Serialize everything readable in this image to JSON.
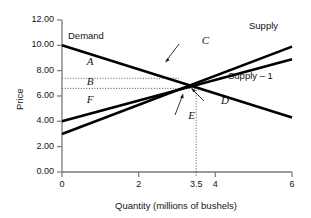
{
  "chart_data": {
    "type": "line",
    "title": "",
    "xlabel": "Quantity (millions of bushels)",
    "ylabel": "Price",
    "xlim": [
      0,
      6
    ],
    "ylim": [
      0,
      12
    ],
    "grid": false,
    "legend_position": "inline-curve-labels",
    "xticks": [
      {
        "value": 0,
        "label": "0",
        "style": "solid"
      },
      {
        "value": 2,
        "label": "2",
        "style": "solid"
      },
      {
        "value": 3.5,
        "label": "3.5",
        "style": "dotted"
      },
      {
        "value": 4,
        "label": "4",
        "style": "solid"
      },
      {
        "value": 6,
        "label": "6",
        "style": "solid"
      }
    ],
    "yticks": [
      {
        "value": 0,
        "label": "0.00"
      },
      {
        "value": 2,
        "label": "2.00"
      },
      {
        "value": 4,
        "label": "4.00"
      },
      {
        "value": 6,
        "label": "6.00"
      },
      {
        "value": 8,
        "label": "8.00"
      },
      {
        "value": 10,
        "label": "10.00"
      },
      {
        "value": 12,
        "label": "12.00"
      }
    ],
    "series": [
      {
        "name": "Demand",
        "label": "Demand",
        "x": [
          0,
          6
        ],
        "y": [
          10.0,
          4.3
        ],
        "color": "#000000"
      },
      {
        "name": "Supply",
        "label": "Supply",
        "x": [
          0,
          6
        ],
        "y": [
          3.0,
          9.9
        ],
        "color": "#000000"
      },
      {
        "name": "Supply-1",
        "label": "Supply – 1",
        "x": [
          0,
          6
        ],
        "y": [
          4.0,
          8.9
        ],
        "color": "#000000"
      }
    ],
    "annotations": [
      {
        "text": "A",
        "x": 0.75,
        "y": 8.6
      },
      {
        "text": "B",
        "x": 0.75,
        "y": 7.0
      },
      {
        "text": "F",
        "x": 0.75,
        "y": 5.6
      },
      {
        "text": "C",
        "x": 3.75,
        "y": 10.3
      },
      {
        "text": "E",
        "x": 3.4,
        "y": 4.35
      },
      {
        "text": "D",
        "x": 4.25,
        "y": 5.5
      }
    ],
    "guides": [
      {
        "type": "hline",
        "y": 7.4,
        "from_x": 0,
        "to_x": 3.05,
        "style": "dotted"
      },
      {
        "type": "hline",
        "y": 6.6,
        "from_x": 0,
        "to_x": 3.5,
        "style": "dotted"
      },
      {
        "type": "vline",
        "x": 3.5,
        "from_y": 0,
        "to_y": 6.6,
        "style": "dotted"
      }
    ],
    "equilibria": [
      {
        "label": "C",
        "x": 3.05,
        "y": 7.4,
        "note": "Demand x Supply-1"
      },
      {
        "label": "D",
        "x": 3.5,
        "y": 6.6,
        "note": "Demand x Supply"
      }
    ]
  },
  "colors": {
    "curve": "#000000",
    "axis": "#6b6b6b",
    "guide": "#555555",
    "text": "#141414"
  }
}
